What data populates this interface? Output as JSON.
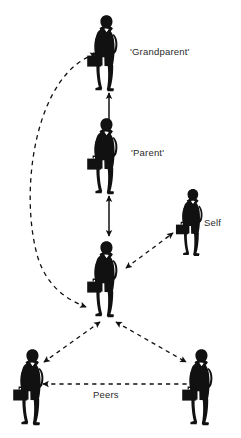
{
  "diagram": {
    "background_color": "#ffffff",
    "figure_color": "#111111",
    "label_color": "#2b2b2b",
    "nodes": [
      {
        "id": "grandparent",
        "label": "'Grandparent'",
        "icon": "businessman-silhouette-icon",
        "x": 105,
        "y": 50,
        "scale": 1.0
      },
      {
        "id": "parent",
        "label": "'Parent'",
        "icon": "businessman-silhouette-icon",
        "x": 105,
        "y": 152,
        "scale": 1.0
      },
      {
        "id": "self",
        "label": "Self",
        "icon": "businessman-silhouette-icon",
        "x": 194,
        "y": 220,
        "scale": 0.88
      },
      {
        "id": "center",
        "label": "",
        "icon": "businessman-silhouette-icon",
        "x": 105,
        "y": 275,
        "scale": 1.0
      },
      {
        "id": "peer-left",
        "label": "",
        "icon": "businessman-silhouette-icon",
        "x": 32,
        "y": 385,
        "scale": 1.0
      },
      {
        "id": "peer-right",
        "label": "Peers",
        "icon": "businessman-silhouette-icon",
        "x": 202,
        "y": 385,
        "scale": 1.0
      }
    ],
    "connectors": [
      {
        "id": "grandparent-parent",
        "style": "solid",
        "arrows": "both",
        "from": "grandparent",
        "to": "parent"
      },
      {
        "id": "parent-center",
        "style": "solid",
        "arrows": "both",
        "from": "parent",
        "to": "center"
      },
      {
        "id": "grandparent-center-curve",
        "style": "dashed",
        "arrows": "both",
        "from": "grandparent",
        "to": "center"
      },
      {
        "id": "center-self",
        "style": "dashed",
        "arrows": "both",
        "from": "center",
        "to": "self"
      },
      {
        "id": "center-peer-left",
        "style": "dashed",
        "arrows": "both",
        "from": "center",
        "to": "peer-left"
      },
      {
        "id": "center-peer-right",
        "style": "dashed",
        "arrows": "both",
        "from": "center",
        "to": "peer-right"
      },
      {
        "id": "peer-left-peer-right",
        "style": "dashed",
        "arrows": "both",
        "from": "peer-left",
        "to": "peer-right",
        "label": "Peers"
      }
    ],
    "labels": {
      "grandparent": "'Grandparent'",
      "parent": "'Parent'",
      "self": "Self",
      "peers": "Peers"
    }
  }
}
